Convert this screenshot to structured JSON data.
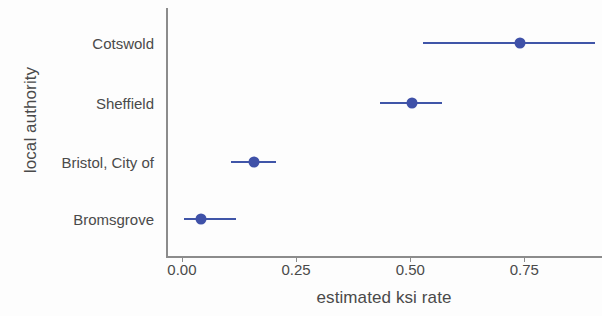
{
  "chart_data": {
    "type": "scatter",
    "title": "",
    "xlabel": "estimated ksi rate",
    "ylabel": "local authority",
    "xlim": [
      -0.035,
      0.92
    ],
    "xticks": [
      0.0,
      0.25,
      0.5,
      0.75
    ],
    "xticklabels": [
      "0.00",
      "0.25",
      "0.50",
      "0.75"
    ],
    "categories": [
      "Bromsgrove",
      "Bristol, City of",
      "Sheffield",
      "Cotswold"
    ],
    "grid": false,
    "legend": null,
    "orientation": "horizontal",
    "marker_color": "#3f51a8",
    "line_color": "#4055a8",
    "axis_color": "#8c8c8c",
    "text_color": "#4a4a4a",
    "points": [
      {
        "category": "Cotswold",
        "value": 0.737,
        "low": 0.524,
        "high": 0.9
      },
      {
        "category": "Sheffield",
        "value": 0.5,
        "low": 0.429,
        "high": 0.566
      },
      {
        "category": "Bristol, City of",
        "value": 0.153,
        "low": 0.104,
        "high": 0.201
      },
      {
        "category": "Bromsgrove",
        "value": 0.038,
        "low": 0.0,
        "high": 0.115
      }
    ]
  }
}
